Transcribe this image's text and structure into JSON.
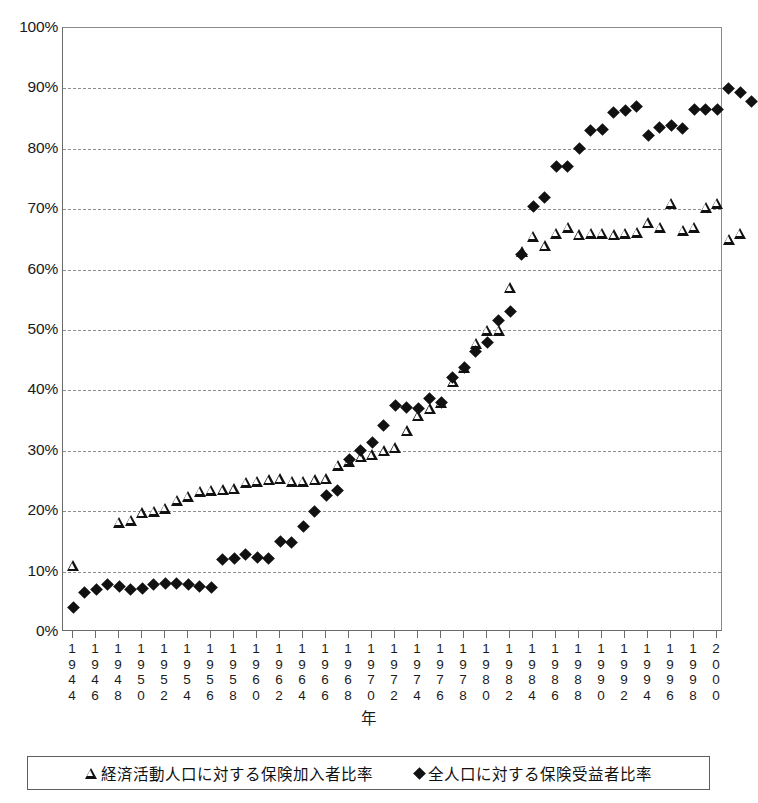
{
  "chart_data": {
    "type": "scatter",
    "title": "",
    "xlabel": "年",
    "ylabel": "",
    "ylim": [
      0,
      100
    ],
    "yticks": [
      "0%",
      "10%",
      "20%",
      "30%",
      "40%",
      "50%",
      "60%",
      "70%",
      "80%",
      "90%",
      "100%"
    ],
    "ytick_values": [
      0,
      10,
      20,
      30,
      40,
      50,
      60,
      70,
      80,
      90,
      100
    ],
    "y_unit": "%",
    "grid": "horizontal-dashed",
    "legend_position": "bottom",
    "xlim": [
      1944,
      2000
    ],
    "xtick_labels": [
      "1944",
      "1946",
      "1948",
      "1950",
      "1952",
      "1954",
      "1956",
      "1958",
      "1960",
      "1962",
      "1964",
      "1966",
      "1968",
      "1970",
      "1972",
      "1974",
      "1976",
      "1978",
      "1980",
      "1982",
      "1984",
      "1986",
      "1988",
      "1990",
      "1992",
      "1994",
      "1996",
      "1998",
      "2000"
    ],
    "series": [
      {
        "name": "経済活動人口に対する保険加入者比率",
        "marker": "open-triangle",
        "color": "#111111",
        "points": [
          {
            "x": 1944,
            "y": 11.0
          },
          {
            "x": 1948,
            "y": 18.2
          },
          {
            "x": 1949,
            "y": 18.5
          },
          {
            "x": 1950,
            "y": 19.8
          },
          {
            "x": 1951,
            "y": 20.0
          },
          {
            "x": 1952,
            "y": 20.5
          },
          {
            "x": 1953,
            "y": 21.8
          },
          {
            "x": 1954,
            "y": 22.5
          },
          {
            "x": 1955,
            "y": 23.3
          },
          {
            "x": 1956,
            "y": 23.5
          },
          {
            "x": 1957,
            "y": 23.6
          },
          {
            "x": 1958,
            "y": 23.7
          },
          {
            "x": 1959,
            "y": 24.8
          },
          {
            "x": 1960,
            "y": 25.0
          },
          {
            "x": 1961,
            "y": 25.2
          },
          {
            "x": 1962,
            "y": 25.4
          },
          {
            "x": 1963,
            "y": 25.0
          },
          {
            "x": 1964,
            "y": 25.0
          },
          {
            "x": 1965,
            "y": 25.2
          },
          {
            "x": 1966,
            "y": 25.4
          },
          {
            "x": 1967,
            "y": 27.6
          },
          {
            "x": 1968,
            "y": 28.3
          },
          {
            "x": 1969,
            "y": 29.0
          },
          {
            "x": 1970,
            "y": 29.4
          },
          {
            "x": 1971,
            "y": 30.0
          },
          {
            "x": 1972,
            "y": 30.5
          },
          {
            "x": 1973,
            "y": 33.3
          },
          {
            "x": 1974,
            "y": 35.8
          },
          {
            "x": 1975,
            "y": 37.0
          },
          {
            "x": 1976,
            "y": 38.0
          },
          {
            "x": 1977,
            "y": 41.4
          },
          {
            "x": 1978,
            "y": 43.8
          },
          {
            "x": 1979,
            "y": 47.8
          },
          {
            "x": 1980,
            "y": 50.0
          },
          {
            "x": 1981,
            "y": 50.0
          },
          {
            "x": 1982,
            "y": 57.0
          },
          {
            "x": 1983,
            "y": 63.0
          },
          {
            "x": 1984,
            "y": 65.5
          },
          {
            "x": 1985,
            "y": 64.0
          },
          {
            "x": 1986,
            "y": 66.0
          },
          {
            "x": 1987,
            "y": 67.0
          },
          {
            "x": 1988,
            "y": 65.8
          },
          {
            "x": 1989,
            "y": 66.0
          },
          {
            "x": 1990,
            "y": 66.0
          },
          {
            "x": 1991,
            "y": 65.8
          },
          {
            "x": 1992,
            "y": 66.0
          },
          {
            "x": 1993,
            "y": 66.2
          },
          {
            "x": 1994,
            "y": 67.8
          },
          {
            "x": 1995,
            "y": 67.0
          },
          {
            "x": 1996,
            "y": 71.0
          },
          {
            "x": 1997,
            "y": 66.5
          },
          {
            "x": 1998,
            "y": 67.0
          },
          {
            "x": 1999,
            "y": 70.3
          },
          {
            "x": 2000,
            "y": 71.0
          },
          {
            "x": 2001,
            "y": 65.0
          },
          {
            "x": 2002,
            "y": 66.0
          }
        ]
      },
      {
        "name": "全人口に対する保険受益者比率",
        "marker": "filled-diamond",
        "color": "#111111",
        "points": [
          {
            "x": 1944,
            "y": 4.0
          },
          {
            "x": 1945,
            "y": 6.5
          },
          {
            "x": 1946,
            "y": 7.0
          },
          {
            "x": 1947,
            "y": 7.8
          },
          {
            "x": 1948,
            "y": 7.5
          },
          {
            "x": 1949,
            "y": 7.0
          },
          {
            "x": 1950,
            "y": 7.2
          },
          {
            "x": 1951,
            "y": 7.8
          },
          {
            "x": 1952,
            "y": 8.0
          },
          {
            "x": 1953,
            "y": 8.0
          },
          {
            "x": 1954,
            "y": 7.8
          },
          {
            "x": 1955,
            "y": 7.5
          },
          {
            "x": 1956,
            "y": 7.4
          },
          {
            "x": 1957,
            "y": 12.0
          },
          {
            "x": 1958,
            "y": 12.2
          },
          {
            "x": 1959,
            "y": 12.8
          },
          {
            "x": 1960,
            "y": 12.4
          },
          {
            "x": 1961,
            "y": 12.2
          },
          {
            "x": 1962,
            "y": 15.0
          },
          {
            "x": 1963,
            "y": 14.8
          },
          {
            "x": 1964,
            "y": 17.5
          },
          {
            "x": 1965,
            "y": 20.0
          },
          {
            "x": 1966,
            "y": 22.6
          },
          {
            "x": 1967,
            "y": 23.5
          },
          {
            "x": 1968,
            "y": 28.5
          },
          {
            "x": 1969,
            "y": 30.0
          },
          {
            "x": 1970,
            "y": 31.3
          },
          {
            "x": 1971,
            "y": 34.2
          },
          {
            "x": 1972,
            "y": 37.5
          },
          {
            "x": 1973,
            "y": 37.2
          },
          {
            "x": 1974,
            "y": 37.0
          },
          {
            "x": 1975,
            "y": 38.7
          },
          {
            "x": 1976,
            "y": 38.0
          },
          {
            "x": 1977,
            "y": 42.2
          },
          {
            "x": 1978,
            "y": 43.8
          },
          {
            "x": 1979,
            "y": 46.5
          },
          {
            "x": 1980,
            "y": 48.0
          },
          {
            "x": 1981,
            "y": 51.5
          },
          {
            "x": 1982,
            "y": 53.0
          },
          {
            "x": 1983,
            "y": 62.5
          },
          {
            "x": 1984,
            "y": 70.5
          },
          {
            "x": 1985,
            "y": 72.0
          },
          {
            "x": 1986,
            "y": 77.0
          },
          {
            "x": 1987,
            "y": 77.0
          },
          {
            "x": 1988,
            "y": 80.0
          },
          {
            "x": 1989,
            "y": 83.0
          },
          {
            "x": 1990,
            "y": 83.2
          },
          {
            "x": 1991,
            "y": 86.0
          },
          {
            "x": 1992,
            "y": 86.3
          },
          {
            "x": 1993,
            "y": 87.0
          },
          {
            "x": 1994,
            "y": 82.2
          },
          {
            "x": 1995,
            "y": 83.5
          },
          {
            "x": 1996,
            "y": 83.8
          },
          {
            "x": 1997,
            "y": 83.4
          },
          {
            "x": 1998,
            "y": 86.5
          },
          {
            "x": 1999,
            "y": 86.5
          },
          {
            "x": 2000,
            "y": 86.5
          },
          {
            "x": 2001,
            "y": 90.0
          },
          {
            "x": 2002,
            "y": 89.3
          },
          {
            "x": 2003,
            "y": 87.8
          }
        ]
      }
    ]
  },
  "legend": {
    "entries": [
      {
        "glyph": "open-triangle",
        "label": "経済活動人口に対する保険加入者比率"
      },
      {
        "glyph": "filled-diamond",
        "label": "全人口に対する保険受益者比率"
      }
    ]
  }
}
